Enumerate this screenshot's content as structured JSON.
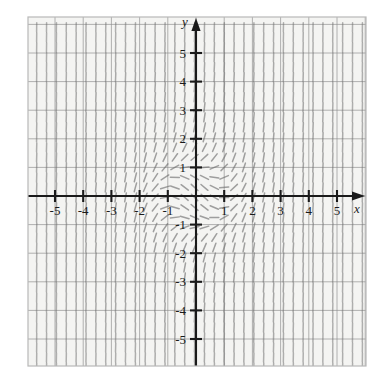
{
  "figure": {
    "title": "",
    "background_color": "#ffffff",
    "plot_background_color": "#f4f4f2",
    "border_color": "#b8b8b8",
    "grid_color": "#8f8f8f",
    "axis_color": "#1a1a1a",
    "tick_color": "#1a1a1a",
    "segment_color": "#6f6f6f",
    "label_color": "#1a1a1a"
  },
  "axes": {
    "x_label": "x",
    "y_label": "y",
    "x_ticks": [
      "-5",
      "-4",
      "-3",
      "-2",
      "-1",
      "1",
      "2",
      "3",
      "4",
      "5"
    ],
    "y_ticks": [
      "5",
      "4",
      "3",
      "2",
      "1",
      "-1",
      "-2",
      "-3",
      "-4",
      "-5"
    ],
    "xlim": [
      -6,
      6
    ],
    "ylim": [
      -6,
      6
    ],
    "x_tick_values": [
      -5,
      -4,
      -3,
      -2,
      -1,
      1,
      2,
      3,
      4,
      5
    ],
    "y_tick_values": [
      5,
      4,
      3,
      2,
      1,
      -1,
      -2,
      -3,
      -4,
      -5
    ],
    "grid": true,
    "grid_step": 1,
    "arrow_x": true,
    "arrow_y": true
  },
  "chart_data": {
    "type": "scatter",
    "plot_kind": "slope-field",
    "title": "",
    "xlabel": "x",
    "ylabel": "y",
    "xlim": [
      -6,
      6
    ],
    "ylim": [
      -6,
      6
    ],
    "grid": true,
    "legend": null,
    "slope_model": "x*x + y*y - 1",
    "sample_step": 0.35,
    "segment_length_px": 9,
    "x_tick_labels": [
      "-5",
      "-4",
      "-3",
      "-2",
      "-1",
      "1",
      "2",
      "3",
      "4",
      "5"
    ],
    "y_tick_labels": [
      "5",
      "4",
      "3",
      "2",
      "1",
      "-1",
      "-2",
      "-3",
      "-4",
      "-5"
    ]
  },
  "geometry": {
    "plot_left": 28,
    "plot_top": 17,
    "plot_right": 366,
    "plot_bottom": 366,
    "origin_x": 196,
    "origin_y": 196,
    "unit_px_x": 28.2,
    "unit_px_y": 28.6
  }
}
